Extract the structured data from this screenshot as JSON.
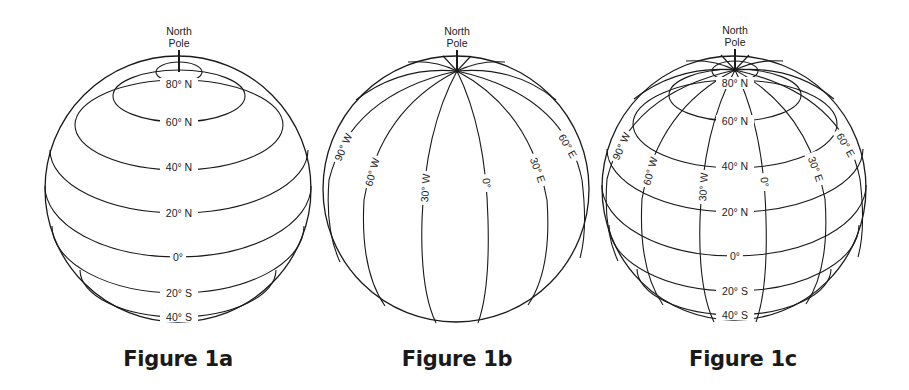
{
  "figures": [
    {
      "id": "1a",
      "caption": "Figure 1a",
      "pole_label_line1": "North",
      "pole_label_line2": "Pole",
      "description": "Globe showing lines of latitude",
      "latitude_labels": [
        "80° N",
        "60° N",
        "40° N",
        "20° N",
        "0°",
        "20° S",
        "40° S"
      ]
    },
    {
      "id": "1b",
      "caption": "Figure 1b",
      "pole_label_line1": "North",
      "pole_label_line2": "Pole",
      "description": "Globe showing lines of longitude",
      "longitude_labels": [
        "90° W",
        "60° W",
        "30° W",
        "0°",
        "30° E",
        "60° E"
      ]
    },
    {
      "id": "1c",
      "caption": "Figure 1c",
      "pole_label_line1": "North",
      "pole_label_line2": "Pole",
      "description": "Globe showing latitude and longitude grid",
      "latitude_labels": [
        "80° N",
        "60° N",
        "40° N",
        "20° N",
        "0°",
        "20° S",
        "40° S"
      ],
      "longitude_labels": [
        "90° W",
        "60° W",
        "30° W",
        "0°",
        "30° E",
        "60° E"
      ]
    }
  ],
  "colors": {
    "line": "#1a1a1a",
    "text": "#222222",
    "background": "#ffffff"
  }
}
